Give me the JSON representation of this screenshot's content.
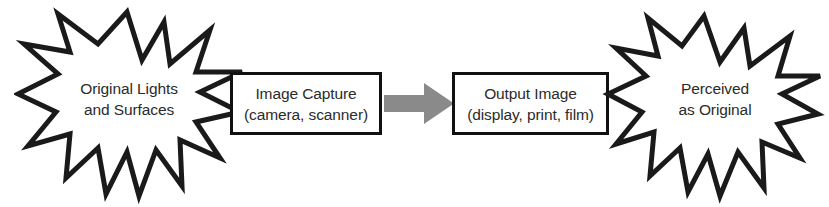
{
  "diagram": {
    "background_color": "#ffffff",
    "outline_color": "#1a1a1a",
    "text_color": "#2b2b2b",
    "arrow_color": "#8a8a8a",
    "nodes": [
      {
        "id": "original",
        "shape": "starburst",
        "label_line1": "Original Lights",
        "label_line2": "and Surfaces"
      },
      {
        "id": "capture",
        "shape": "rectangle",
        "label_line1": "Image Capture",
        "label_line2": "(camera, scanner)"
      },
      {
        "id": "output",
        "shape": "rectangle",
        "label_line1": "Output Image",
        "label_line2": "(display, print, film)"
      },
      {
        "id": "perceived",
        "shape": "starburst",
        "label_line1": "Perceived",
        "label_line2": "as Original"
      }
    ],
    "connector": {
      "id": "capture-to-output",
      "type": "block-arrow",
      "direction": "right",
      "color": "#8a8a8a"
    }
  }
}
